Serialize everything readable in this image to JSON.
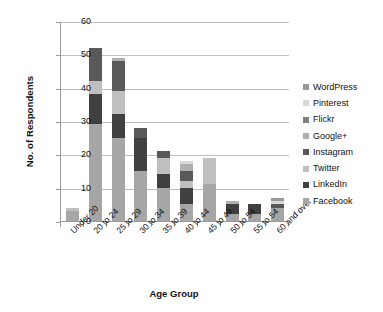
{
  "chart_data": {
    "type": "bar",
    "stacked": true,
    "title": "",
    "xlabel": "Age Group",
    "ylabel": "No. of Respondents",
    "ylim": [
      0,
      60
    ],
    "yticks": [
      0,
      10,
      20,
      30,
      40,
      50,
      60
    ],
    "grid": true,
    "legend_position": "right",
    "categories": [
      "Under 20",
      "20 to 24",
      "25 to 29",
      "30 to 34",
      "35 to 39",
      "40 to 44",
      "45 to 49",
      "50 to 54",
      "55 to 54",
      "60 and over"
    ],
    "series": [
      {
        "name": "Facebook",
        "color": "#a6a6a6",
        "values": [
          3,
          29,
          25,
          15,
          10,
          5,
          11,
          2,
          2,
          4
        ]
      },
      {
        "name": "LinkedIn",
        "color": "#404040",
        "values": [
          0,
          9,
          7,
          10,
          4,
          5,
          0,
          3,
          3,
          0
        ]
      },
      {
        "name": "Twitter",
        "color": "#bfbfbf",
        "values": [
          1,
          4,
          7,
          0,
          5,
          2,
          8,
          0,
          0,
          0
        ]
      },
      {
        "name": "Instagram",
        "color": "#595959",
        "values": [
          0,
          10,
          9,
          3,
          2,
          3,
          0,
          0,
          0,
          1
        ]
      },
      {
        "name": "Google+",
        "color": "#b0b0b0",
        "values": [
          0,
          0,
          1,
          0,
          0,
          2,
          0,
          1,
          0,
          0
        ]
      },
      {
        "name": "Flickr",
        "color": "#7f7f7f",
        "values": [
          0,
          0,
          0,
          0,
          0,
          0,
          0,
          0,
          0,
          0
        ]
      },
      {
        "name": "Pinterest",
        "color": "#d9d9d9",
        "values": [
          0,
          0,
          0,
          0,
          0,
          1,
          0,
          0,
          0,
          1
        ]
      },
      {
        "name": "WordPress",
        "color": "#999999",
        "values": [
          0,
          0,
          0,
          0,
          0,
          0,
          0,
          0,
          0,
          1
        ]
      }
    ],
    "totals": [
      4,
      52,
      49,
      28,
      21,
      18,
      19,
      6,
      5,
      7
    ],
    "legend_order": [
      "WordPress",
      "Pinterest",
      "Flickr",
      "Google+",
      "Instagram",
      "Twitter",
      "LinkedIn",
      "Facebook"
    ]
  },
  "legend": {
    "items": [
      {
        "label": "WordPress",
        "color": "#999999"
      },
      {
        "label": "Pinterest",
        "color": "#d9d9d9"
      },
      {
        "label": "Flickr",
        "color": "#7f7f7f"
      },
      {
        "label": "Google+",
        "color": "#b0b0b0"
      },
      {
        "label": "Instagram",
        "color": "#595959"
      },
      {
        "label": "Twitter",
        "color": "#bfbfbf"
      },
      {
        "label": "LinkedIn",
        "color": "#404040"
      },
      {
        "label": "Facebook",
        "color": "#a6a6a6"
      }
    ]
  },
  "axes": {
    "y_title": "No. of Respondents",
    "x_title": "Age Group"
  }
}
